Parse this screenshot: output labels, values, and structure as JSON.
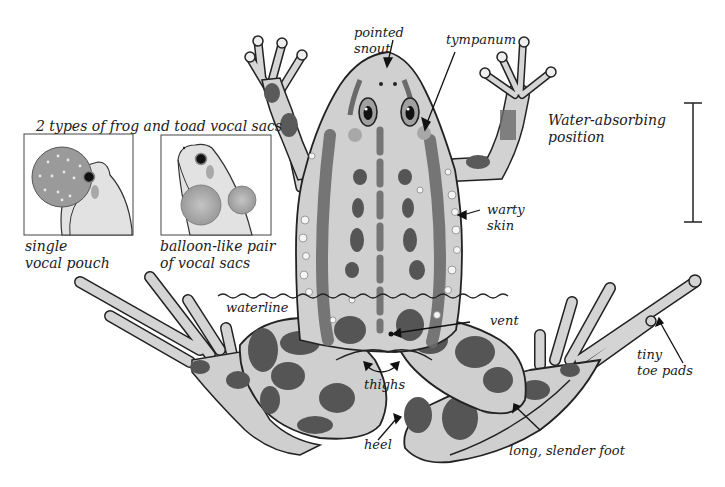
{
  "diagram": {
    "palette": {
      "background": "#ffffff",
      "skin": "#cfcfcf",
      "skin_light": "#e3e3e3",
      "spot": "#555555",
      "stripe": "#6a6a6a",
      "outline": "#222222",
      "tympanum": "#a8a8a8",
      "wart": "#f4f4f4"
    }
  },
  "inset": {
    "title": "2 types of frog and toad vocal sacs",
    "panels": [
      {
        "id": "single",
        "caption_line1": "single",
        "caption_line2": "vocal pouch"
      },
      {
        "id": "pair",
        "caption_line1": "balloon-like pair",
        "caption_line2": "of vocal sacs"
      }
    ]
  },
  "labels": {
    "pointed_snout": {
      "line1": "pointed",
      "line2": "snout"
    },
    "tympanum": {
      "line1": "tympanum"
    },
    "water_absorbing": {
      "line1": "Water-absorbing",
      "line2": "position"
    },
    "warty_skin": {
      "line1": "warty",
      "line2": "skin"
    },
    "waterline": {
      "line1": "waterline"
    },
    "vent": {
      "line1": "vent"
    },
    "thighs": {
      "line1": "thighs"
    },
    "tiny_toe_pads": {
      "line1": "tiny",
      "line2": "toe pads"
    },
    "heel": {
      "line1": "heel"
    },
    "long_slender_foot": {
      "line1": "long, slender foot"
    }
  }
}
